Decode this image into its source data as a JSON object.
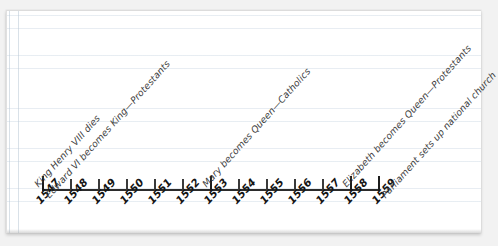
{
  "page": {
    "background_color": "#f2f2f2",
    "paper_color": "#ffffff",
    "rule_color": "#b2c4d6",
    "ink_color": "#2b2b2b"
  },
  "chart_data": {
    "type": "timeline",
    "title": "",
    "xlabel": "",
    "ylabel": "",
    "axis_range": [
      1547,
      1559
    ],
    "grid": false,
    "legend": "none",
    "categories": [
      "1547",
      "1548",
      "1549",
      "1550",
      "1551",
      "1552",
      "1553",
      "1554",
      "1555",
      "1556",
      "1557",
      "1558",
      "1559"
    ],
    "ticks": [
      {
        "year": "1547",
        "major": true
      },
      {
        "year": "1548",
        "major": false
      },
      {
        "year": "1549",
        "major": false
      },
      {
        "year": "1550",
        "major": false
      },
      {
        "year": "1551",
        "major": false
      },
      {
        "year": "1552",
        "major": false
      },
      {
        "year": "1553",
        "major": true
      },
      {
        "year": "1554",
        "major": false
      },
      {
        "year": "1555",
        "major": false
      },
      {
        "year": "1556",
        "major": false
      },
      {
        "year": "1557",
        "major": false
      },
      {
        "year": "1558",
        "major": true
      },
      {
        "year": "1559",
        "major": true
      }
    ],
    "events": [
      {
        "year": "1547",
        "label": "King Henry VIII dies"
      },
      {
        "year": "1547",
        "label": "Edward VI becomes King—Protestants"
      },
      {
        "year": "1553",
        "label": "Mary becomes Queen—Catholics"
      },
      {
        "year": "1558",
        "label": "Elizabeth becomes Queen—Protestants"
      },
      {
        "year": "1559",
        "label": "Parliament sets up national church"
      }
    ]
  }
}
